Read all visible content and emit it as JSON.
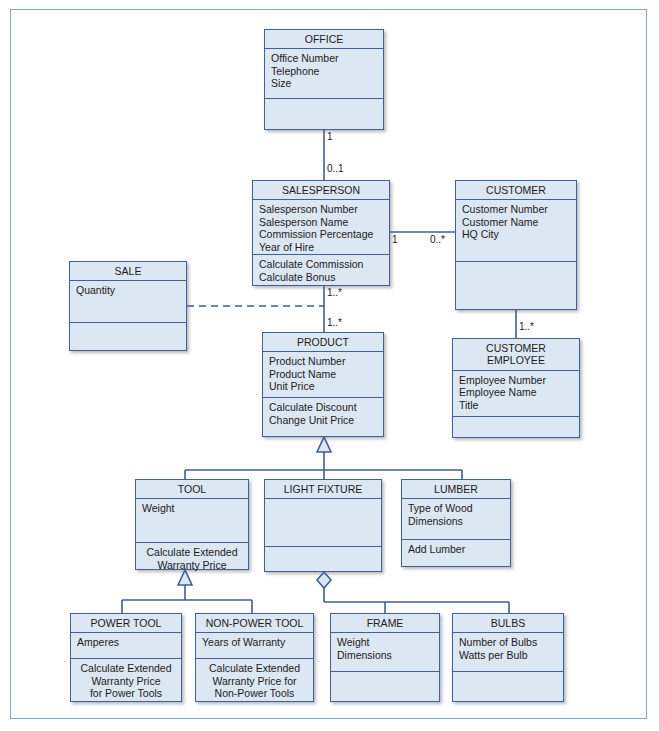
{
  "diagram": {
    "type": "uml-class-diagram",
    "classes": [
      {
        "id": "office",
        "name": "OFFICE",
        "attributes": "Office Number\nTelephone\nSize",
        "operations": ""
      },
      {
        "id": "salesperson",
        "name": "SALESPERSON",
        "attributes": "Salesperson Number\nSalesperson Name\nCommission Percentage\nYear of Hire",
        "operations": "Calculate Commission\nCalculate Bonus"
      },
      {
        "id": "customer",
        "name": "CUSTOMER",
        "attributes": "Customer Number\nCustomer Name\nHQ City",
        "operations": ""
      },
      {
        "id": "sale",
        "name": "SALE",
        "attributes": "Quantity",
        "operations": ""
      },
      {
        "id": "product",
        "name": "PRODUCT",
        "attributes": "Product Number\nProduct Name\nUnit Price",
        "operations": "Calculate Discount\nChange Unit Price"
      },
      {
        "id": "customer-employee",
        "name": "CUSTOMER\nEMPLOYEE",
        "attributes": "Employee Number\nEmployee Name\nTitle",
        "operations": ""
      },
      {
        "id": "tool",
        "name": "TOOL",
        "attributes": "Weight",
        "operations": "Calculate Extended\nWarranty Price"
      },
      {
        "id": "light-fixture",
        "name": "LIGHT FIXTURE",
        "attributes": "",
        "operations": ""
      },
      {
        "id": "lumber",
        "name": "LUMBER",
        "attributes": "Type of Wood\nDimensions",
        "operations": "Add Lumber"
      },
      {
        "id": "power-tool",
        "name": "POWER TOOL",
        "attributes": "Amperes",
        "operations": "Calculate Extended\nWarranty Price\nfor Power Tools"
      },
      {
        "id": "non-power-tool",
        "name": "NON-POWER TOOL",
        "attributes": "Years of Warranty",
        "operations": "Calculate Extended\nWarranty Price for\nNon-Power Tools"
      },
      {
        "id": "frame",
        "name": "FRAME",
        "attributes": "Weight\nDimensions",
        "operations": ""
      },
      {
        "id": "bulbs",
        "name": "BULBS",
        "attributes": "Number of Bulbs\nWatts per Bulb",
        "operations": ""
      }
    ],
    "multiplicities": {
      "office_to_salesperson_office_end": "1",
      "office_to_salesperson_salesperson_end": "0..1",
      "salesperson_to_customer_salesperson_end": "1",
      "salesperson_to_customer_customer_end": "0..*",
      "salesperson_to_product_salesperson_end": "1..*",
      "salesperson_to_product_product_end": "1..*",
      "customer_to_employee_customer_end": "1",
      "customer_to_employee_employee_end": "1..*"
    },
    "colors": {
      "class_fill": "#dce7f4",
      "class_border": "#43608f",
      "connector": "#3f5f93",
      "page_border": "#8aa0c4",
      "page_background": "#ffffff"
    }
  }
}
